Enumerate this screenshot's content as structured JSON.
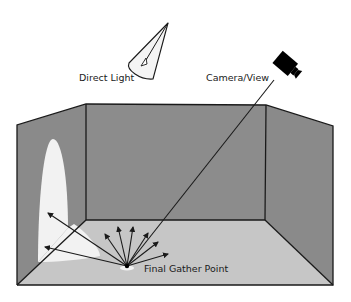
{
  "diagram": {
    "labels": {
      "direct_light": "Direct Light",
      "camera": "Camera/View",
      "gather_point": "Final Gather Point"
    },
    "colors": {
      "side_wall": "#8a8a8a",
      "back_wall": "#8c8c8c",
      "floor": "#c6c6c6",
      "light_patch": "#f2f2f2",
      "outline": "#1a1a1a",
      "camera": "#000000"
    },
    "room": {
      "outer_top_left": [
        17,
        125
      ],
      "outer_top_right": [
        333,
        126
      ],
      "outer_bottom_left": [
        17,
        285
      ],
      "outer_bottom_right": [
        333,
        285
      ],
      "back_top_left": [
        86,
        104
      ],
      "back_top_right": [
        266,
        105
      ],
      "back_bottom_left": [
        86,
        220
      ],
      "back_bottom_right": [
        265,
        220
      ]
    },
    "gather_point": [
      127,
      266
    ],
    "gather_rays": [
      [
        105,
        234
      ],
      [
        118,
        227
      ],
      [
        133,
        227
      ],
      [
        148,
        233
      ],
      [
        158,
        242
      ],
      [
        168,
        254
      ],
      [
        48,
        213
      ],
      [
        45,
        247
      ]
    ]
  }
}
